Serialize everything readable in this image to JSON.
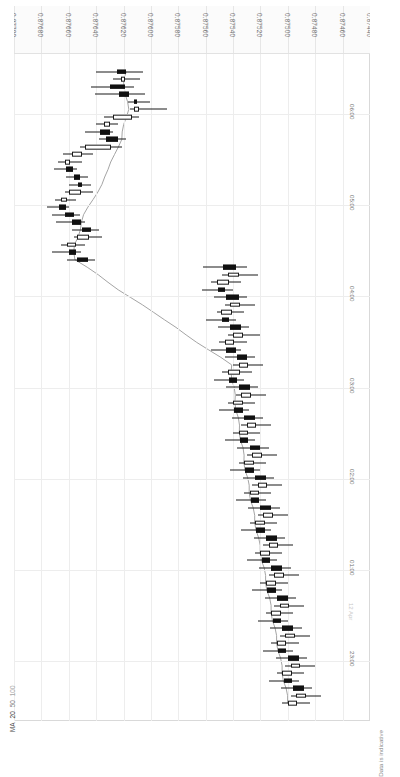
{
  "chart_data": {
    "type": "candlestick",
    "title": "",
    "orientation": "rotated-90",
    "xlabel": "",
    "ylabel": "",
    "price_axis": {
      "labels": [
        "0.87700",
        "0.87680",
        "0.87660",
        "0.87640",
        "0.87620",
        "0.87600",
        "0.87580",
        "0.87560",
        "0.87540",
        "0.87520",
        "0.87500",
        "0.87480",
        "0.87460",
        "0.87440"
      ],
      "min": 0.8744,
      "max": 0.877,
      "step": 0.0002,
      "grid": true
    },
    "time_axis": {
      "labels": [
        "06:00",
        "05:00",
        "04:00",
        "03:00",
        "02:00",
        "01:00",
        "23:00"
      ],
      "date_marker": "12 Apr",
      "grid": true
    },
    "legend": {
      "title": "MA",
      "entries": [
        "20",
        "50",
        "100"
      ],
      "position": "bottom-left"
    },
    "note": "Data is indicative",
    "colors": {
      "bullish_body": "#ffffff",
      "bearish_body": "#111111",
      "outline": "#1a1a1a",
      "grid": "#ededed",
      "frame": "#d9d9d9",
      "axis_text": "#6e6e6e",
      "ma_line": "#9a9a9a",
      "background": "#ffffff"
    },
    "candles": [
      {
        "t": "06:00",
        "o": 0.87625,
        "h": 0.8764,
        "l": 0.87606,
        "c": 0.87618,
        "dir": "down"
      },
      {
        "t": "05:55",
        "o": 0.87619,
        "h": 0.87628,
        "l": 0.87608,
        "c": 0.87622,
        "dir": "up"
      },
      {
        "t": "05:50",
        "o": 0.8763,
        "h": 0.87644,
        "l": 0.87612,
        "c": 0.87619,
        "dir": "down"
      },
      {
        "t": "05:45",
        "o": 0.87623,
        "h": 0.87641,
        "l": 0.87604,
        "c": 0.87616,
        "dir": "down"
      },
      {
        "t": "05:40",
        "o": 0.87612,
        "h": 0.87617,
        "l": 0.87601,
        "c": 0.8761,
        "dir": "down"
      },
      {
        "t": "05:35",
        "o": 0.87609,
        "h": 0.87615,
        "l": 0.87588,
        "c": 0.87612,
        "dir": "up"
      },
      {
        "t": "05:30",
        "o": 0.87614,
        "h": 0.87634,
        "l": 0.87609,
        "c": 0.87628,
        "dir": "up"
      },
      {
        "t": "05:25",
        "o": 0.8763,
        "h": 0.8764,
        "l": 0.87624,
        "c": 0.87634,
        "dir": "up"
      },
      {
        "t": "05:20",
        "o": 0.87637,
        "h": 0.87648,
        "l": 0.87628,
        "c": 0.8763,
        "dir": "down"
      },
      {
        "t": "05:15",
        "o": 0.87633,
        "h": 0.87638,
        "l": 0.87618,
        "c": 0.87624,
        "dir": "down"
      },
      {
        "t": "05:10",
        "o": 0.87629,
        "h": 0.87652,
        "l": 0.87621,
        "c": 0.87648,
        "dir": "up"
      },
      {
        "t": "05:05",
        "o": 0.8765,
        "h": 0.87664,
        "l": 0.87642,
        "c": 0.87658,
        "dir": "up"
      },
      {
        "t": "05:00",
        "o": 0.87659,
        "h": 0.87668,
        "l": 0.8765,
        "c": 0.87663,
        "dir": "up"
      },
      {
        "t": "04:55",
        "o": 0.87662,
        "h": 0.87671,
        "l": 0.87654,
        "c": 0.87657,
        "dir": "down"
      },
      {
        "t": "04:50",
        "o": 0.87656,
        "h": 0.87662,
        "l": 0.87646,
        "c": 0.87652,
        "dir": "down"
      },
      {
        "t": "04:45",
        "o": 0.87653,
        "h": 0.8766,
        "l": 0.87644,
        "c": 0.8765,
        "dir": "down"
      },
      {
        "t": "04:40",
        "o": 0.87651,
        "h": 0.87663,
        "l": 0.87642,
        "c": 0.8766,
        "dir": "up"
      },
      {
        "t": "04:35",
        "o": 0.87661,
        "h": 0.8767,
        "l": 0.87655,
        "c": 0.87666,
        "dir": "up"
      },
      {
        "t": "04:30",
        "o": 0.87667,
        "h": 0.87676,
        "l": 0.8766,
        "c": 0.87662,
        "dir": "down"
      },
      {
        "t": "04:25",
        "o": 0.87663,
        "h": 0.87672,
        "l": 0.87652,
        "c": 0.87656,
        "dir": "down"
      },
      {
        "t": "04:20",
        "o": 0.87658,
        "h": 0.87669,
        "l": 0.87648,
        "c": 0.87651,
        "dir": "down"
      },
      {
        "t": "04:15",
        "o": 0.8765,
        "h": 0.87658,
        "l": 0.87638,
        "c": 0.87644,
        "dir": "down"
      },
      {
        "t": "04:10",
        "o": 0.87645,
        "h": 0.87656,
        "l": 0.87636,
        "c": 0.87654,
        "dir": "up"
      },
      {
        "t": "04:05",
        "o": 0.87655,
        "h": 0.87666,
        "l": 0.87648,
        "c": 0.87661,
        "dir": "up"
      },
      {
        "t": "04:00",
        "o": 0.8766,
        "h": 0.87672,
        "l": 0.87651,
        "c": 0.87655,
        "dir": "down"
      },
      {
        "t": "03:55",
        "o": 0.87654,
        "h": 0.87661,
        "l": 0.87641,
        "c": 0.87646,
        "dir": "down"
      },
      {
        "t": "03:50",
        "o": 0.87547,
        "h": 0.87562,
        "l": 0.8753,
        "c": 0.87538,
        "dir": "down"
      },
      {
        "t": "03:45",
        "o": 0.87536,
        "h": 0.87548,
        "l": 0.87522,
        "c": 0.87544,
        "dir": "up"
      },
      {
        "t": "03:40",
        "o": 0.87543,
        "h": 0.87556,
        "l": 0.87534,
        "c": 0.87552,
        "dir": "up"
      },
      {
        "t": "03:35",
        "o": 0.87551,
        "h": 0.87563,
        "l": 0.8754,
        "c": 0.87546,
        "dir": "down"
      },
      {
        "t": "03:30",
        "o": 0.87545,
        "h": 0.87554,
        "l": 0.8753,
        "c": 0.87536,
        "dir": "down"
      },
      {
        "t": "03:25",
        "o": 0.87535,
        "h": 0.87546,
        "l": 0.87524,
        "c": 0.87542,
        "dir": "up"
      },
      {
        "t": "03:20",
        "o": 0.87541,
        "h": 0.87552,
        "l": 0.87532,
        "c": 0.87549,
        "dir": "up"
      },
      {
        "t": "03:15",
        "o": 0.87548,
        "h": 0.8756,
        "l": 0.87538,
        "c": 0.87543,
        "dir": "down"
      },
      {
        "t": "03:10",
        "o": 0.87542,
        "h": 0.87551,
        "l": 0.87528,
        "c": 0.87534,
        "dir": "down"
      },
      {
        "t": "03:05",
        "o": 0.87533,
        "h": 0.87544,
        "l": 0.8752,
        "c": 0.8754,
        "dir": "up"
      },
      {
        "t": "03:00",
        "o": 0.87539,
        "h": 0.8755,
        "l": 0.8753,
        "c": 0.87546,
        "dir": "up"
      },
      {
        "t": "02:55",
        "o": 0.87545,
        "h": 0.87556,
        "l": 0.87534,
        "c": 0.87538,
        "dir": "down"
      },
      {
        "t": "02:50",
        "o": 0.87537,
        "h": 0.87546,
        "l": 0.87524,
        "c": 0.8753,
        "dir": "down"
      },
      {
        "t": "02:45",
        "o": 0.87529,
        "h": 0.8754,
        "l": 0.87518,
        "c": 0.87536,
        "dir": "up"
      },
      {
        "t": "02:40",
        "o": 0.87535,
        "h": 0.87548,
        "l": 0.87526,
        "c": 0.87544,
        "dir": "up"
      },
      {
        "t": "02:35",
        "o": 0.87543,
        "h": 0.87554,
        "l": 0.87532,
        "c": 0.87537,
        "dir": "down"
      },
      {
        "t": "02:30",
        "o": 0.87536,
        "h": 0.87545,
        "l": 0.87522,
        "c": 0.87528,
        "dir": "down"
      },
      {
        "t": "02:25",
        "o": 0.87527,
        "h": 0.87538,
        "l": 0.87516,
        "c": 0.87534,
        "dir": "up"
      },
      {
        "t": "02:20",
        "o": 0.87533,
        "h": 0.87544,
        "l": 0.87524,
        "c": 0.8754,
        "dir": "up"
      },
      {
        "t": "02:15",
        "o": 0.87539,
        "h": 0.8755,
        "l": 0.87528,
        "c": 0.87533,
        "dir": "down"
      },
      {
        "t": "02:10",
        "o": 0.87532,
        "h": 0.87541,
        "l": 0.87518,
        "c": 0.87524,
        "dir": "down"
      },
      {
        "t": "02:05",
        "o": 0.87523,
        "h": 0.87534,
        "l": 0.87512,
        "c": 0.8753,
        "dir": "up"
      },
      {
        "t": "02:00",
        "o": 0.87529,
        "h": 0.8754,
        "l": 0.8752,
        "c": 0.87536,
        "dir": "up"
      },
      {
        "t": "01:55",
        "o": 0.87535,
        "h": 0.87546,
        "l": 0.87524,
        "c": 0.87529,
        "dir": "down"
      },
      {
        "t": "01:50",
        "o": 0.87528,
        "h": 0.87537,
        "l": 0.87514,
        "c": 0.8752,
        "dir": "down"
      },
      {
        "t": "01:45",
        "o": 0.87519,
        "h": 0.8753,
        "l": 0.87508,
        "c": 0.87526,
        "dir": "up"
      },
      {
        "t": "01:40",
        "o": 0.87525,
        "h": 0.87536,
        "l": 0.87516,
        "c": 0.87532,
        "dir": "up"
      },
      {
        "t": "01:35",
        "o": 0.87531,
        "h": 0.87542,
        "l": 0.8752,
        "c": 0.87525,
        "dir": "down"
      },
      {
        "t": "01:30",
        "o": 0.87524,
        "h": 0.87533,
        "l": 0.8751,
        "c": 0.87516,
        "dir": "down"
      },
      {
        "t": "01:25",
        "o": 0.87515,
        "h": 0.87526,
        "l": 0.87504,
        "c": 0.87522,
        "dir": "up"
      },
      {
        "t": "01:20",
        "o": 0.87521,
        "h": 0.87532,
        "l": 0.87512,
        "c": 0.87528,
        "dir": "up"
      },
      {
        "t": "01:15",
        "o": 0.87527,
        "h": 0.87538,
        "l": 0.87516,
        "c": 0.87521,
        "dir": "down"
      },
      {
        "t": "01:10",
        "o": 0.8752,
        "h": 0.87529,
        "l": 0.87506,
        "c": 0.87512,
        "dir": "down"
      },
      {
        "t": "01:05",
        "o": 0.87511,
        "h": 0.87522,
        "l": 0.875,
        "c": 0.87518,
        "dir": "up"
      },
      {
        "t": "01:00",
        "o": 0.87517,
        "h": 0.87528,
        "l": 0.87508,
        "c": 0.87524,
        "dir": "up"
      },
      {
        "t": "00:55",
        "o": 0.87523,
        "h": 0.87534,
        "l": 0.87512,
        "c": 0.87517,
        "dir": "down"
      },
      {
        "t": "00:50",
        "o": 0.87516,
        "h": 0.87525,
        "l": 0.87502,
        "c": 0.87508,
        "dir": "down"
      },
      {
        "t": "00:45",
        "o": 0.87507,
        "h": 0.87518,
        "l": 0.87496,
        "c": 0.87514,
        "dir": "up"
      },
      {
        "t": "00:40",
        "o": 0.87513,
        "h": 0.87524,
        "l": 0.87504,
        "c": 0.8752,
        "dir": "up"
      },
      {
        "t": "00:35",
        "o": 0.87519,
        "h": 0.8753,
        "l": 0.87508,
        "c": 0.87513,
        "dir": "down"
      },
      {
        "t": "00:30",
        "o": 0.87512,
        "h": 0.87521,
        "l": 0.87498,
        "c": 0.87504,
        "dir": "down"
      },
      {
        "t": "00:25",
        "o": 0.87503,
        "h": 0.87514,
        "l": 0.87492,
        "c": 0.8751,
        "dir": "up"
      },
      {
        "t": "00:20",
        "o": 0.87509,
        "h": 0.8752,
        "l": 0.875,
        "c": 0.87516,
        "dir": "up"
      },
      {
        "t": "00:15",
        "o": 0.87515,
        "h": 0.87526,
        "l": 0.87504,
        "c": 0.87509,
        "dir": "down"
      },
      {
        "t": "00:10",
        "o": 0.87508,
        "h": 0.87517,
        "l": 0.87494,
        "c": 0.875,
        "dir": "down"
      },
      {
        "t": "00:05",
        "o": 0.87499,
        "h": 0.8751,
        "l": 0.87488,
        "c": 0.87506,
        "dir": "up"
      },
      {
        "t": "00:00",
        "o": 0.87505,
        "h": 0.87516,
        "l": 0.87496,
        "c": 0.87512,
        "dir": "up"
      },
      {
        "t": "23:55",
        "o": 0.87511,
        "h": 0.87522,
        "l": 0.875,
        "c": 0.87505,
        "dir": "down"
      },
      {
        "t": "23:50",
        "o": 0.87504,
        "h": 0.87513,
        "l": 0.8749,
        "c": 0.87496,
        "dir": "down"
      },
      {
        "t": "23:45",
        "o": 0.87495,
        "h": 0.87506,
        "l": 0.87484,
        "c": 0.87502,
        "dir": "up"
      },
      {
        "t": "23:40",
        "o": 0.87501,
        "h": 0.87512,
        "l": 0.87492,
        "c": 0.87508,
        "dir": "up"
      },
      {
        "t": "23:35",
        "o": 0.87507,
        "h": 0.87518,
        "l": 0.87496,
        "c": 0.87501,
        "dir": "down"
      },
      {
        "t": "23:30",
        "o": 0.875,
        "h": 0.87509,
        "l": 0.87486,
        "c": 0.87492,
        "dir": "down"
      },
      {
        "t": "23:25",
        "o": 0.87491,
        "h": 0.87502,
        "l": 0.8748,
        "c": 0.87498,
        "dir": "up"
      },
      {
        "t": "23:20",
        "o": 0.87497,
        "h": 0.87508,
        "l": 0.87488,
        "c": 0.87504,
        "dir": "up"
      },
      {
        "t": "23:15",
        "o": 0.87503,
        "h": 0.87514,
        "l": 0.87492,
        "c": 0.87497,
        "dir": "down"
      },
      {
        "t": "23:10",
        "o": 0.87496,
        "h": 0.87505,
        "l": 0.87482,
        "c": 0.87488,
        "dir": "down"
      },
      {
        "t": "23:05",
        "o": 0.87487,
        "h": 0.87498,
        "l": 0.87476,
        "c": 0.87494,
        "dir": "up"
      },
      {
        "t": "23:00",
        "o": 0.87493,
        "h": 0.87504,
        "l": 0.87484,
        "c": 0.875,
        "dir": "up"
      }
    ]
  }
}
